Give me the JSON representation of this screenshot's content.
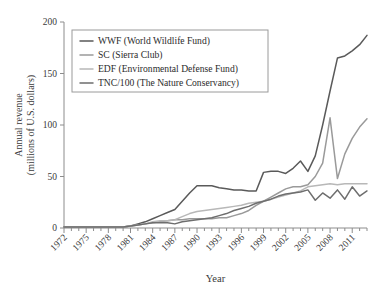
{
  "chart_data": {
    "type": "line",
    "title": "",
    "xlabel": "Year",
    "ylabel": "Annual revenue (millions of U.S. dollars)",
    "ylabel_line1": "Annual revenue",
    "ylabel_line2": "(millions of U.S. dollars)",
    "xlim": [
      1972,
      2013
    ],
    "ylim": [
      0,
      200
    ],
    "yticks": [
      0,
      50,
      100,
      150,
      200
    ],
    "xticks": [
      1972,
      1975,
      1978,
      1981,
      1984,
      1987,
      1990,
      1993,
      1996,
      1999,
      2002,
      2005,
      2008,
      2011
    ],
    "xtick_minor_step": 1,
    "grid": false,
    "legend_position": "top-left-inside",
    "legend_entries": [
      "WWF (World Wildlife Fund)",
      "SC (Sierra Club)",
      "EDF (Environmental Defense Fund)",
      "TNC/100 (The Nature Conservancy)"
    ],
    "colors": {
      "WWF": "#5a5a5a",
      "SC": "#9a9a9a",
      "EDF": "#b8b8b8",
      "TNC/100": "#6e6e6e",
      "axis": "#8c8c8c",
      "legend_border": "#9a9a9a",
      "background": "#ffffff"
    },
    "x": [
      1972,
      1973,
      1974,
      1975,
      1976,
      1977,
      1978,
      1979,
      1980,
      1981,
      1982,
      1983,
      1984,
      1985,
      1986,
      1987,
      1988,
      1989,
      1990,
      1991,
      1992,
      1993,
      1994,
      1995,
      1996,
      1997,
      1998,
      1999,
      2000,
      2001,
      2002,
      2003,
      2004,
      2005,
      2006,
      2007,
      2008,
      2009,
      2010,
      2011,
      2012,
      2013
    ],
    "series": [
      {
        "name": "WWF (World Wildlife Fund)",
        "short": "WWF",
        "color": "#5a5a5a",
        "values": [
          1,
          1,
          1,
          1,
          1,
          1,
          1,
          1,
          1,
          2,
          4,
          6,
          9,
          12,
          15,
          18,
          26,
          34,
          41,
          41,
          41,
          39,
          38,
          37,
          37,
          36,
          36,
          54,
          55,
          55,
          53,
          58,
          65,
          55,
          70,
          100,
          133,
          165,
          167,
          172,
          178,
          187
        ]
      },
      {
        "name": "SC (Sierra Club)",
        "short": "SC",
        "color": "#9a9a9a",
        "values": [
          1,
          1,
          1,
          1,
          1,
          1,
          1,
          1,
          1,
          2,
          3,
          4,
          5,
          6,
          7,
          8,
          8,
          9,
          9,
          9,
          9,
          10,
          10,
          12,
          14,
          17,
          22,
          26,
          30,
          34,
          38,
          40,
          40,
          42,
          50,
          63,
          107,
          48,
          72,
          87,
          98,
          106
        ]
      },
      {
        "name": "EDF (Environmental Defense Fund)",
        "short": "EDF",
        "color": "#b8b8b8",
        "values": [
          1,
          1,
          1,
          1,
          1,
          1,
          1,
          1,
          1,
          2,
          3,
          4,
          6,
          7,
          7,
          8,
          11,
          14,
          16,
          17,
          18,
          19,
          20,
          21,
          22,
          24,
          25,
          26,
          28,
          30,
          32,
          34,
          36,
          40,
          41,
          42,
          43,
          42,
          43,
          43,
          43,
          43
        ]
      },
      {
        "name": "TNC/100 (The Nature Conservancy)",
        "short": "TNC/100",
        "color": "#6e6e6e",
        "values": [
          1,
          1,
          1,
          1,
          1,
          1,
          1,
          1,
          1,
          2,
          3,
          4,
          5,
          5,
          5,
          4,
          6,
          7,
          8,
          9,
          10,
          12,
          14,
          17,
          19,
          21,
          24,
          26,
          28,
          31,
          33,
          34,
          35,
          37,
          27,
          34,
          29,
          37,
          28,
          40,
          31,
          36
        ]
      }
    ]
  }
}
